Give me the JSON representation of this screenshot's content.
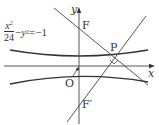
{
  "figure": {
    "equation": {
      "numerator": "x",
      "numerator_exp": "2",
      "denominator": "24",
      "rest_var": "y",
      "rest_exp": "2",
      "rest": "=−1",
      "minus": "−"
    },
    "labels": {
      "y_axis": "y",
      "x_axis": "x",
      "origin": "O",
      "focus_top": "F",
      "focus_bottom": "F′",
      "point": "P"
    },
    "colors": {
      "stroke": "#333333",
      "background": "#ffffff"
    }
  }
}
